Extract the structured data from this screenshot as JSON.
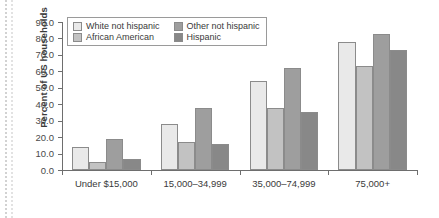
{
  "chart_data": {
    "type": "bar",
    "title": "",
    "xlabel": "",
    "ylabel": "Percent of US households",
    "categories": [
      "Under $15,000",
      "15,000–34,999",
      "35,000–74,999",
      "75,000+"
    ],
    "series": [
      {
        "name": "White not hispanic",
        "color": "#e9e9e9",
        "values": [
          14.0,
          28.0,
          54.0,
          78.0
        ]
      },
      {
        "name": "African American",
        "color": "#c2c2c2",
        "values": [
          5.0,
          17.0,
          38.0,
          63.0
        ]
      },
      {
        "name": "Other not hispanic",
        "color": "#9e9e9e",
        "values": [
          19.0,
          38.0,
          62.0,
          83.0
        ]
      },
      {
        "name": "Hispanic",
        "color": "#888888",
        "values": [
          7.0,
          16.0,
          35.0,
          73.0
        ]
      }
    ],
    "ylim": [
      0.0,
      90.0
    ],
    "ytick_values": [
      0.0,
      10.0,
      20.0,
      30.0,
      40.0,
      50.0,
      60.0,
      70.0,
      80.0,
      90.0
    ],
    "ytick_labels": [
      "0.0",
      "10.0",
      "20.0",
      "30.0",
      "40.0",
      "50.0",
      "60.0",
      "70.0",
      "80.0",
      "90.0"
    ],
    "grid": false,
    "legend_position": "top-left"
  },
  "legend": {
    "entries": [
      {
        "label": "White not hispanic"
      },
      {
        "label": "Other not hispanic"
      },
      {
        "label": "African American"
      },
      {
        "label": "Hispanic"
      }
    ]
  }
}
